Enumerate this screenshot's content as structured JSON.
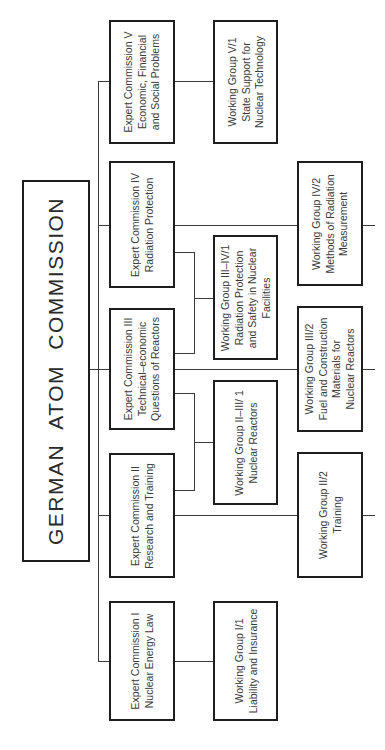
{
  "chart_title": "GERMAN ATOM COMMISSION",
  "orientation": "rotated 90 degrees counterclockwise",
  "root": {
    "label": "GERMAN ATOM COMMISSION"
  },
  "expert_commissions": [
    {
      "id": "I",
      "lines": [
        "Expert  Commission I",
        "Nuclear  Energy Law"
      ]
    },
    {
      "id": "II",
      "lines": [
        "Expert  Commission II",
        "Research and Training"
      ]
    },
    {
      "id": "III",
      "lines": [
        "Expert  Commission III",
        "Technical–economic",
        "Questions of Reactors"
      ]
    },
    {
      "id": "IV",
      "lines": [
        "Expert  Commission IV",
        "Radiation   Protection"
      ]
    },
    {
      "id": "V",
      "lines": [
        "Expert  Commission V",
        "Economic,  Financial",
        "and  Social  Problems"
      ]
    }
  ],
  "working_groups": [
    {
      "id": "I/1",
      "parent": [
        "I"
      ],
      "lines": [
        "Working  Group  I/1",
        "Liability and Insurance"
      ]
    },
    {
      "id": "II-III/1",
      "parent": [
        "II",
        "III"
      ],
      "lines": [
        "Working  Group II–III/ 1",
        "Nuclear  Reactors"
      ]
    },
    {
      "id": "II/2",
      "parent": [
        "II"
      ],
      "lines": [
        "Working  Group  II/2",
        "Training"
      ]
    },
    {
      "id": "III-IV/1",
      "parent": [
        "III",
        "IV"
      ],
      "lines": [
        "Working  Group  III–IV/1",
        "Radiation    Protection",
        "and  Safety in Nuclear",
        "Facilities"
      ]
    },
    {
      "id": "III/2",
      "parent": [
        "III"
      ],
      "lines": [
        "Working  Group  III/2",
        "Fuel and Construction",
        "Materials for",
        "Nuclear  Reactors"
      ]
    },
    {
      "id": "IV/2",
      "parent": [
        "IV"
      ],
      "lines": [
        "Working  Group  IV/2",
        "Methods of  Radiation",
        "Measurement"
      ]
    },
    {
      "id": "V/1",
      "parent": [
        "V"
      ],
      "lines": [
        "Working  Group  V/1",
        "State  Support for",
        "Nuclear Technology"
      ]
    }
  ],
  "colors": {
    "line": "#3a3a3a",
    "border": "#1e1e1e",
    "background": "#ffffff",
    "text": "#3a3a3a"
  }
}
